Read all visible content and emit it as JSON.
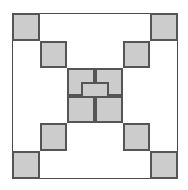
{
  "figure": {
    "canvas": {
      "width": 188,
      "height": 190,
      "background": "#ffffff"
    },
    "frame": {
      "name": "outer-frame",
      "x": 12,
      "y": 13,
      "width": 166,
      "height": 166,
      "border_color": "#4a4a4a",
      "border_width": 1,
      "fill": "#ffffff"
    },
    "grid": {
      "rows": 6,
      "cols": 6,
      "cell_size": 27.6,
      "origin_x": 12,
      "origin_y": 13
    },
    "style": {
      "cell_fill": "#cccccc",
      "cell_border": "#555555",
      "cell_border_width": 2
    },
    "cells": [
      {
        "name": "cell-top-left-corner",
        "x": 12.0,
        "y": 13.0,
        "w": 27.6,
        "h": 27.6
      },
      {
        "name": "cell-tl-diag-2",
        "x": 39.6,
        "y": 40.6,
        "w": 27.6,
        "h": 27.6
      },
      {
        "name": "cell-tl-diag-3",
        "x": 67.2,
        "y": 68.2,
        "w": 27.6,
        "h": 27.6
      },
      {
        "name": "cell-top-right-corner",
        "x": 150.4,
        "y": 13.0,
        "w": 27.6,
        "h": 27.6
      },
      {
        "name": "cell-tr-diag-2",
        "x": 122.8,
        "y": 40.6,
        "w": 27.6,
        "h": 27.6
      },
      {
        "name": "cell-tr-diag-3",
        "x": 95.2,
        "y": 68.2,
        "w": 27.6,
        "h": 27.6
      },
      {
        "name": "cell-center",
        "x": 81.4,
        "y": 81.9,
        "w": 27.6,
        "h": 27.6
      },
      {
        "name": "cell-bl-diag-3",
        "x": 67.2,
        "y": 95.8,
        "w": 27.6,
        "h": 27.6
      },
      {
        "name": "cell-bl-diag-2",
        "x": 39.6,
        "y": 123.4,
        "w": 27.6,
        "h": 27.6
      },
      {
        "name": "cell-bottom-left-corner",
        "x": 12.0,
        "y": 151.0,
        "w": 27.6,
        "h": 27.6
      },
      {
        "name": "cell-br-diag-3",
        "x": 95.2,
        "y": 95.8,
        "w": 27.6,
        "h": 27.6
      },
      {
        "name": "cell-br-diag-2",
        "x": 122.8,
        "y": 123.4,
        "w": 27.6,
        "h": 27.6
      },
      {
        "name": "cell-bottom-right-corner",
        "x": 150.4,
        "y": 151.0,
        "w": 27.6,
        "h": 27.6
      }
    ]
  }
}
